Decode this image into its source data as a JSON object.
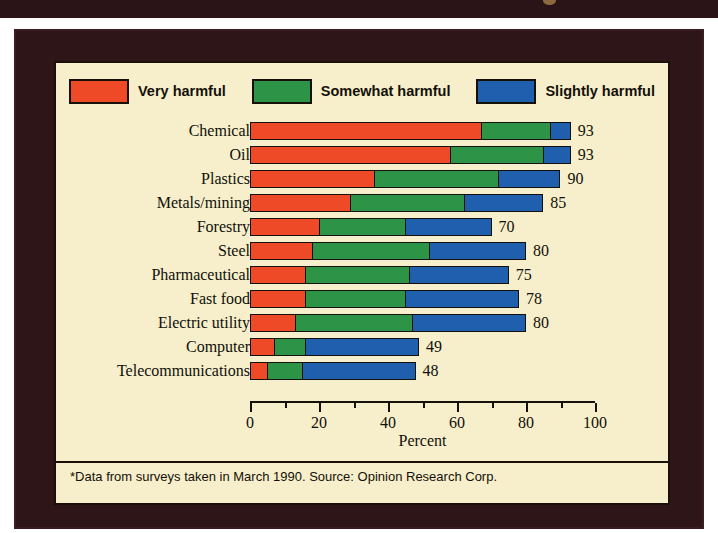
{
  "figure": {
    "background_color": "#f7efcb",
    "panel_color": "#2e1518",
    "footnote": "*Data from surveys taken in March 1990.  Source: Opinion Research Corp."
  },
  "legend": {
    "items": [
      {
        "label": "Very harmful",
        "color": "#ee4a27",
        "swatch": "red-swatch"
      },
      {
        "label": "Somewhat harmful",
        "color": "#2d9346",
        "swatch": "green-swatch"
      },
      {
        "label": "Slightly harmful",
        "color": "#1f5fad",
        "swatch": "blue-swatch"
      }
    ]
  },
  "chart_data": {
    "type": "bar",
    "orientation": "horizontal",
    "stacked": true,
    "title": "",
    "subtitle": "",
    "xlabel": "Percent",
    "ylabel": "",
    "xlim": [
      0,
      100
    ],
    "xticks": [
      0,
      10,
      20,
      30,
      40,
      50,
      60,
      70,
      80,
      90,
      100
    ],
    "xticklabels": [
      "0",
      "",
      "20",
      "",
      "40",
      "",
      "60",
      "",
      "80",
      "",
      "100"
    ],
    "grid": false,
    "legend_position": "top",
    "categories": [
      "Chemical",
      "Oil",
      "Plastics",
      "Metals/mining",
      "Forestry",
      "Steel",
      "Pharmaceutical",
      "Fast food",
      "Electric utility",
      "Computer",
      "Telecommunications"
    ],
    "series": [
      {
        "name": "Very harmful",
        "color": "#ee4a27",
        "values": [
          67,
          58,
          36,
          29,
          20,
          18,
          16,
          16,
          13,
          7,
          5
        ]
      },
      {
        "name": "Somewhat harmful",
        "color": "#2d9346",
        "values": [
          20,
          27,
          36,
          33,
          25,
          34,
          30,
          29,
          34,
          9,
          10
        ]
      },
      {
        "name": "Slightly harmful",
        "color": "#1f5fad",
        "values": [
          6,
          8,
          18,
          23,
          25,
          28,
          29,
          33,
          33,
          33,
          33
        ]
      }
    ],
    "totals": [
      93,
      93,
      90,
      85,
      70,
      80,
      75,
      78,
      80,
      49,
      48
    ],
    "total_labels": [
      "93",
      "93",
      "90",
      "85",
      "70",
      "80",
      "75",
      "78",
      "80",
      "49",
      "48"
    ]
  }
}
